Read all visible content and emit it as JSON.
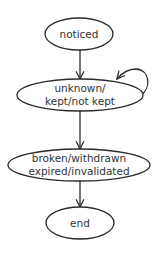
{
  "diagram": {
    "type": "state-diagram",
    "stroke_color": "#2b2b2b",
    "text_color": "#333333",
    "nodes": [
      {
        "id": "noticed",
        "lines": [
          "noticed"
        ]
      },
      {
        "id": "status",
        "lines": [
          "unknown/",
          "kept/not kept"
        ]
      },
      {
        "id": "terminal",
        "lines": [
          "broken/withdrawn",
          "expired/invalidated"
        ]
      },
      {
        "id": "end",
        "lines": [
          "end"
        ]
      }
    ],
    "edges": [
      {
        "from": "noticed",
        "to": "status"
      },
      {
        "from": "status",
        "to": "status",
        "self_loop": true
      },
      {
        "from": "status",
        "to": "terminal"
      },
      {
        "from": "terminal",
        "to": "end"
      }
    ]
  }
}
